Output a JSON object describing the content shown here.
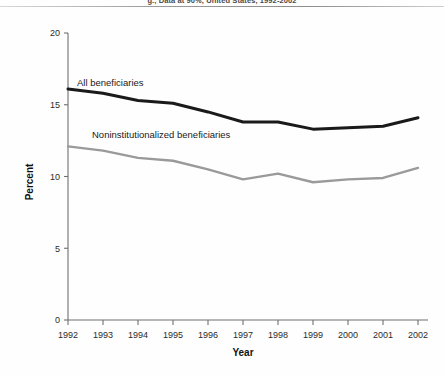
{
  "figure": {
    "title_partial": "g., Data at 90%, United States, 1992-2002",
    "background": "#fefefe"
  },
  "chart_data": {
    "type": "line",
    "title": "",
    "xlabel": "Year",
    "ylabel": "Percent",
    "x": [
      1992,
      1993,
      1994,
      1995,
      1996,
      1997,
      1998,
      1999,
      2000,
      2001,
      2002
    ],
    "categories": [
      "1992",
      "1993",
      "1994",
      "1995",
      "1996",
      "1997",
      "1998",
      "1999",
      "2000",
      "2001",
      "2002"
    ],
    "series": [
      {
        "name": "All beneficiaries",
        "color": "#1a1a1a",
        "values": [
          16.1,
          15.8,
          15.3,
          15.1,
          14.5,
          13.8,
          13.8,
          13.3,
          13.4,
          13.5,
          14.1
        ]
      },
      {
        "name": "Noninstitutionalized beneficiaries",
        "color": "#9a9a9a",
        "values": [
          12.1,
          11.8,
          11.3,
          11.1,
          10.5,
          9.8,
          10.2,
          9.6,
          9.8,
          9.9,
          10.6
        ]
      }
    ],
    "ylim": [
      0,
      20
    ],
    "yticks": [
      0,
      5,
      10,
      15,
      20
    ],
    "ytick_labels": [
      "0",
      "5",
      "10",
      "15",
      "20"
    ],
    "xlim": [
      1992,
      2002
    ],
    "grid": false,
    "legend": "inline-annotations"
  },
  "annotations": [
    {
      "name": "all-beneficiaries-label",
      "text": "All beneficiaries"
    },
    {
      "name": "noninstitutionalized-label",
      "text": "Noninstitutionalized beneficiaries"
    }
  ],
  "axis_titles": {
    "x": "Year",
    "y": "Percent"
  }
}
